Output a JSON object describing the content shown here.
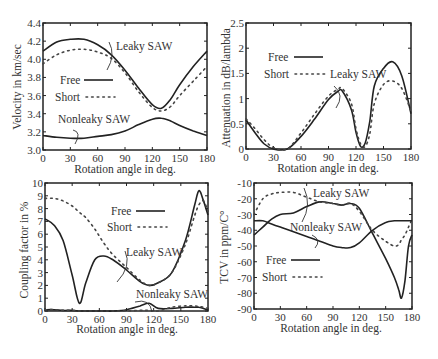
{
  "chart_data": [
    {
      "id": "velocity",
      "type": "line",
      "title": "",
      "xlabel": "Rotation angle in deg.",
      "ylabel": "Velocity in km/sec",
      "xlim": [
        0,
        180
      ],
      "ylim": [
        3.0,
        4.4
      ],
      "xticks": [
        "0",
        "30",
        "60",
        "90",
        "120",
        "150",
        "180"
      ],
      "yticks": [
        "3.0",
        "3.2",
        "3.4",
        "3.6",
        "3.8",
        "4.0",
        "4.2",
        "4.4"
      ],
      "legend": [
        "Free",
        "Short"
      ],
      "annotations": [
        "Leaky SAW",
        "Nonleaky SAW"
      ],
      "x": [
        0,
        15,
        30,
        45,
        60,
        75,
        90,
        105,
        120,
        130,
        140,
        150,
        165,
        180
      ],
      "series": [
        {
          "name": "Leaky SAW - Free",
          "style": "solid",
          "values": [
            4.09,
            4.19,
            4.22,
            4.22,
            4.16,
            4.05,
            3.88,
            3.68,
            3.5,
            3.46,
            3.56,
            3.72,
            3.92,
            4.09
          ]
        },
        {
          "name": "Leaky SAW - Short",
          "style": "dotted",
          "values": [
            3.95,
            4.05,
            4.1,
            4.11,
            4.08,
            4.01,
            3.85,
            3.64,
            3.47,
            3.43,
            3.48,
            3.6,
            3.76,
            3.92
          ]
        },
        {
          "name": "Nonleaky SAW - Free",
          "style": "solid",
          "values": [
            3.16,
            3.14,
            3.13,
            3.13,
            3.15,
            3.17,
            3.21,
            3.28,
            3.34,
            3.35,
            3.32,
            3.27,
            3.21,
            3.16
          ]
        }
      ]
    },
    {
      "id": "attenuation",
      "type": "line",
      "title": "",
      "xlabel": "Rotation angle in deg.",
      "ylabel": "Attenuation in dB/lambda",
      "xlim": [
        0,
        180
      ],
      "ylim": [
        0,
        2.5
      ],
      "xticks": [
        "0",
        "30",
        "60",
        "90",
        "120",
        "150",
        "180"
      ],
      "yticks": [
        "0",
        "0.5",
        "1",
        "1.5",
        "2",
        "2.5"
      ],
      "legend": [
        "Free",
        "Short"
      ],
      "annotations": [
        "Leaky SAW"
      ],
      "x": [
        0,
        10,
        20,
        30,
        45,
        60,
        75,
        90,
        100,
        105,
        115,
        120,
        125,
        130,
        135,
        140,
        150,
        160,
        170,
        180
      ],
      "series": [
        {
          "name": "Leaky SAW - Free",
          "style": "solid",
          "values": [
            0.58,
            0.32,
            0.1,
            0.0,
            0.0,
            0.25,
            0.6,
            0.98,
            1.14,
            1.15,
            0.78,
            0.33,
            0.05,
            0.12,
            0.55,
            1.25,
            1.6,
            1.73,
            1.45,
            0.7
          ]
        },
        {
          "name": "Leaky SAW - Short",
          "style": "dotted",
          "values": [
            0.6,
            0.4,
            0.18,
            0.03,
            0.0,
            0.32,
            0.7,
            1.05,
            1.18,
            1.2,
            0.9,
            0.4,
            0.1,
            0.05,
            0.3,
            0.9,
            1.28,
            1.35,
            1.2,
            0.75
          ]
        }
      ]
    },
    {
      "id": "coupling",
      "type": "line",
      "title": "",
      "xlabel": "Rotation angle in deg.",
      "ylabel": "Coupling factor in %",
      "xlim": [
        0,
        180
      ],
      "ylim": [
        0,
        10
      ],
      "xticks": [
        "0",
        "30",
        "60",
        "90",
        "120",
        "150",
        "180"
      ],
      "yticks": [
        "0",
        "1",
        "2",
        "3",
        "4",
        "5",
        "6",
        "7",
        "8",
        "9",
        "10"
      ],
      "legend": [
        "Free",
        "Short"
      ],
      "annotations": [
        "Leaky SAW",
        "Nonleaky SAW"
      ],
      "x": [
        0,
        10,
        20,
        30,
        38,
        45,
        55,
        65,
        75,
        90,
        105,
        115,
        125,
        140,
        155,
        165,
        170,
        175,
        180
      ],
      "series": [
        {
          "name": "Leaky SAW - Free",
          "style": "solid",
          "values": [
            7.2,
            6.7,
            5.5,
            2.8,
            0.6,
            2.2,
            4.0,
            4.3,
            4.0,
            3.2,
            2.3,
            2.0,
            2.2,
            3.0,
            5.5,
            8.2,
            9.4,
            8.6,
            7.5
          ]
        },
        {
          "name": "Leaky SAW - Short",
          "style": "dotted",
          "values": [
            8.8,
            8.8,
            8.6,
            8.2,
            7.7,
            7.3,
            6.4,
            5.3,
            4.4,
            3.4,
            2.4,
            2.0,
            2.2,
            3.0,
            5.2,
            7.4,
            8.3,
            8.6,
            7.8
          ]
        },
        {
          "name": "Nonleaky SAW - Free",
          "style": "solid",
          "values": [
            0.1,
            0.1,
            0.05,
            0.05,
            0.0,
            0.0,
            0.0,
            0.0,
            0.0,
            0.1,
            0.4,
            0.6,
            0.2,
            0.2,
            0.3,
            0.3,
            0.3,
            0.2,
            0.1
          ]
        },
        {
          "name": "Nonleaky SAW - Short",
          "style": "dotted",
          "values": [
            0.1,
            0.1,
            0.05,
            0.05,
            0.0,
            0.0,
            0.0,
            0.0,
            0.0,
            0.0,
            0.05,
            0.05,
            0.0,
            0.3,
            0.4,
            0.4,
            0.35,
            0.3,
            0.2
          ]
        }
      ]
    },
    {
      "id": "tcv",
      "type": "line",
      "title": "",
      "xlabel": "Rotation angle in deg.",
      "ylabel": "TCV in ppm/C°",
      "xlim": [
        0,
        180
      ],
      "ylim": [
        -90,
        -10
      ],
      "xticks": [
        "0",
        "30",
        "60",
        "90",
        "120",
        "150",
        "180"
      ],
      "yticks": [
        "-90",
        "-80",
        "-70",
        "-60",
        "-50",
        "-40",
        "-30",
        "-20",
        "-10"
      ],
      "legend": [
        "Free",
        "Short"
      ],
      "annotations": [
        "Leaky SAW",
        "Nonleaky SAW"
      ],
      "x": [
        0,
        10,
        20,
        30,
        45,
        60,
        75,
        90,
        100,
        110,
        120,
        135,
        150,
        160,
        165,
        168,
        172,
        176,
        180
      ],
      "series": [
        {
          "name": "Leaky SAW - Free",
          "style": "solid",
          "values": [
            -43,
            -38,
            -33,
            -30,
            -29,
            -25,
            -22,
            -23,
            -24,
            -23,
            -26,
            -42,
            -58,
            -70,
            -78,
            -83,
            -72,
            -50,
            -43
          ]
        },
        {
          "name": "Leaky SAW - Short",
          "style": "dotted",
          "values": [
            -30,
            -20,
            -17,
            -16,
            -16,
            -19,
            -22,
            -23,
            -24,
            -23,
            -28,
            -40,
            -47,
            -50,
            -49,
            -46,
            -43,
            -38,
            -33
          ]
        },
        {
          "name": "Nonleaky SAW - Free",
          "style": "solid",
          "values": [
            -34,
            -34,
            -36,
            -38,
            -41,
            -44,
            -47,
            -50,
            -51,
            -51,
            -48,
            -40,
            -35,
            -34,
            -34,
            -34,
            -34,
            -34,
            -34
          ]
        }
      ]
    }
  ],
  "figure": {
    "panels": [
      {
        "ylabel": "Velocity in km/sec",
        "xlabel": "Rotation angle in deg.",
        "legend_free": "Free",
        "legend_short": "Short",
        "ann1": "Leaky SAW",
        "ann2": "Nonleaky SAW"
      },
      {
        "ylabel": "Attenuation in dB/lambda",
        "xlabel": "Rotation angle in deg.",
        "legend_free": "Free",
        "legend_short": "Short",
        "ann1": "Leaky SAW"
      },
      {
        "ylabel": "Coupling factor in %",
        "xlabel": "Rotation angle in deg.",
        "legend_free": "Free",
        "legend_short": "Short",
        "ann1": "Leaky SAW",
        "ann2": "Nonleaky SAW"
      },
      {
        "ylabel": "TCV in ppm/C°",
        "xlabel": "Rotation angle in deg.",
        "legend_free": "Free",
        "legend_short": "Short",
        "ann1": "Leaky SAW",
        "ann2": "Nonleaky SAW"
      }
    ]
  }
}
